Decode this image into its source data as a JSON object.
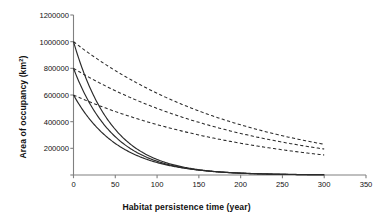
{
  "chart_data": {
    "type": "line",
    "title": "",
    "xlabel": "Habitat persistence time (year)",
    "ylabel": "Area of occupancy (km²)",
    "ylabel_main": "Area of occupancy (km",
    "ylabel_sup": "2",
    "ylabel_tail": ")",
    "xlim": [
      0,
      350
    ],
    "ylim": [
      0,
      1200000
    ],
    "xticks": [
      0,
      50,
      100,
      150,
      200,
      250,
      300,
      350
    ],
    "yticks": [
      0,
      200000,
      400000,
      600000,
      800000,
      1000000,
      1200000
    ],
    "xtick_labels": [
      "0",
      "50",
      "100",
      "150",
      "200",
      "250",
      "300",
      "350"
    ],
    "ytick_labels": [
      "",
      "200000",
      "400000",
      "600000",
      "800000",
      "1000000",
      "1200000"
    ],
    "grid": false,
    "legend": "none",
    "line_color": "#2b2b2b",
    "axis_color": "#808080",
    "series": [
      {
        "name": "solid-upper",
        "style": "solid",
        "x_start": 0,
        "x_end": 300,
        "y0": 1000000,
        "decay_rate": 0.0215,
        "x": [
          0,
          25,
          50,
          75,
          100,
          125,
          150,
          175,
          200,
          225,
          250,
          275,
          300
        ],
        "values": [
          1000000,
          584000,
          341000,
          200000,
          117000,
          68000,
          40000,
          23000,
          14000,
          8000,
          5000,
          3000,
          2000
        ]
      },
      {
        "name": "solid-middle",
        "style": "solid",
        "x_start": 0,
        "x_end": 300,
        "y0": 800000,
        "decay_rate": 0.0205,
        "x": [
          0,
          25,
          50,
          75,
          100,
          125,
          150,
          175,
          200,
          225,
          250,
          275,
          300
        ],
        "values": [
          800000,
          479000,
          287000,
          172000,
          103000,
          62000,
          37000,
          22000,
          13000,
          8000,
          5000,
          3000,
          2000
        ]
      },
      {
        "name": "solid-lower",
        "style": "solid",
        "x_start": 0,
        "x_end": 300,
        "y0": 600000,
        "decay_rate": 0.0186,
        "x": [
          0,
          25,
          50,
          75,
          100,
          125,
          150,
          175,
          200,
          225,
          250,
          275,
          300
        ],
        "values": [
          600000,
          377000,
          236000,
          148000,
          93000,
          59000,
          37000,
          23000,
          15000,
          9000,
          6000,
          4000,
          2000
        ]
      },
      {
        "name": "dashed-upper",
        "style": "dashed",
        "x_start": 0,
        "x_end": 300,
        "y0": 1000000,
        "decay_rate": 0.00489,
        "x": [
          0,
          25,
          50,
          75,
          100,
          125,
          150,
          175,
          200,
          225,
          250,
          275,
          300
        ],
        "values": [
          1000000,
          885000,
          783000,
          693000,
          613000,
          543000,
          480000,
          425000,
          376000,
          333000,
          294000,
          261000,
          231000
        ]
      },
      {
        "name": "dashed-middle",
        "style": "dashed",
        "x_start": 0,
        "x_end": 300,
        "y0": 800000,
        "decay_rate": 0.00471,
        "x": [
          0,
          25,
          50,
          75,
          100,
          125,
          150,
          175,
          200,
          225,
          250,
          275,
          300
        ],
        "values": [
          800000,
          711000,
          632000,
          562000,
          499000,
          444000,
          395000,
          351000,
          312000,
          277000,
          246000,
          219000,
          195000
        ]
      },
      {
        "name": "dashed-lower",
        "style": "dashed",
        "x_start": 0,
        "x_end": 300,
        "y0": 600000,
        "decay_rate": 0.00462,
        "x": [
          0,
          25,
          50,
          75,
          100,
          125,
          150,
          175,
          200,
          225,
          250,
          275,
          300
        ],
        "values": [
          600000,
          535000,
          477000,
          425000,
          378000,
          337000,
          301000,
          268000,
          239000,
          213000,
          190000,
          169000,
          151000
        ]
      }
    ]
  }
}
